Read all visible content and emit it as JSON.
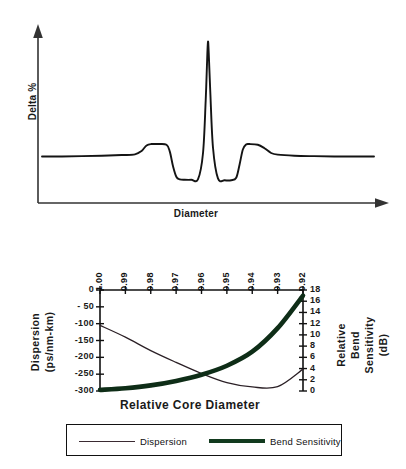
{
  "figures": {
    "profile": {
      "ylabel": "Delta %",
      "xlabel": "Diameter"
    },
    "dispersion": {
      "xtitle": "Relative Core Diameter",
      "left_axis_title_line1": "Dispersion",
      "left_axis_title_line2": "(ps/nm-km)",
      "right_axis_title_line1": "Relative",
      "right_axis_title_line2": "Bend",
      "right_axis_title_line3": "Sensitivity",
      "right_axis_title_line4": "(dB)",
      "legend": [
        {
          "label": "Dispersion",
          "style": "thin",
          "color": "#3a2a32"
        },
        {
          "label": "Bend  Sensitivity",
          "style": "thick",
          "color": "#123a1e"
        }
      ]
    }
  },
  "chart_data": [
    {
      "type": "line",
      "title": "",
      "xlabel": "Diameter",
      "ylabel": "Delta %",
      "grid": false,
      "legend": "none",
      "description": "Segmented-core refractive index profile: flat outer baseline, raised ring, depressed trench, tall narrow central core peak, mirrored trench and ring.",
      "xlim": [
        0,
        100
      ],
      "ylim": [
        -1.2,
        10
      ],
      "series": [
        {
          "name": "Delta % profile",
          "x": [
            0,
            6,
            12,
            18,
            24,
            28,
            30,
            31.5,
            33,
            35,
            37.5,
            38.5,
            39.5,
            40.5,
            41.5,
            43,
            45,
            47,
            48.5,
            49.3,
            49.8,
            50,
            50.2,
            50.7,
            51.5,
            53,
            55,
            57,
            58.5,
            59.5,
            60.5,
            61.5,
            62.5,
            65,
            67,
            69,
            71,
            76,
            82,
            88,
            94,
            100
          ],
          "y": [
            0.95,
            0.95,
            0.97,
            1.0,
            1.05,
            1.1,
            1.35,
            1.75,
            1.85,
            1.85,
            1.8,
            1.3,
            0.2,
            -0.55,
            -0.72,
            -0.75,
            -0.75,
            -0.7,
            1.2,
            5.0,
            8.4,
            9.3,
            8.6,
            5.6,
            1.6,
            -0.65,
            -0.78,
            -0.78,
            -0.6,
            0.35,
            1.45,
            1.82,
            1.85,
            1.8,
            1.55,
            1.2,
            1.08,
            1.0,
            0.97,
            0.95,
            0.95,
            0.95
          ]
        }
      ]
    },
    {
      "type": "line",
      "title": "",
      "xlabel": "Relative Core Diameter",
      "grid": false,
      "legend": "bottom",
      "x_categories": [
        "1.00",
        "0.99",
        "0.98",
        "0.97",
        "0.96",
        "0.95",
        "0.94",
        "0.93",
        "0.92"
      ],
      "x_axis_direction": "descending",
      "left_axis": {
        "label": "Dispersion (ps/nm-km)",
        "ticks": [
          "0",
          "- 50",
          "-100",
          "-150",
          "-200",
          "-250",
          "-300"
        ],
        "tick_values": [
          0,
          -50,
          -100,
          -150,
          -200,
          -250,
          -300
        ],
        "range": [
          -300,
          0
        ]
      },
      "right_axis": {
        "label": "Relative Bend Sensitivity (dB)",
        "ticks": [
          "18",
          "16",
          "14",
          "12",
          "10",
          "8",
          "6",
          "4",
          "2",
          "0"
        ],
        "tick_values": [
          18,
          16,
          14,
          12,
          10,
          8,
          6,
          4,
          2,
          0
        ],
        "range": [
          0,
          18
        ]
      },
      "series": [
        {
          "name": "Dispersion",
          "axis": "left",
          "units": "ps/nm-km",
          "x": [
            "1.00",
            "0.99",
            "0.98",
            "0.97",
            "0.96",
            "0.95",
            "0.94",
            "0.93",
            "0.92"
          ],
          "values": [
            -105,
            -140,
            -180,
            -215,
            -248,
            -275,
            -288,
            -287,
            -235
          ]
        },
        {
          "name": "Bend Sensitivity",
          "axis": "right",
          "units": "dB",
          "x": [
            "1.00",
            "0.99",
            "0.98",
            "0.97",
            "0.96",
            "0.95",
            "0.94",
            "0.93",
            "0.92"
          ],
          "values": [
            0.2,
            0.5,
            1.0,
            1.8,
            2.9,
            4.5,
            7.0,
            11.2,
            17.0
          ]
        }
      ]
    }
  ]
}
